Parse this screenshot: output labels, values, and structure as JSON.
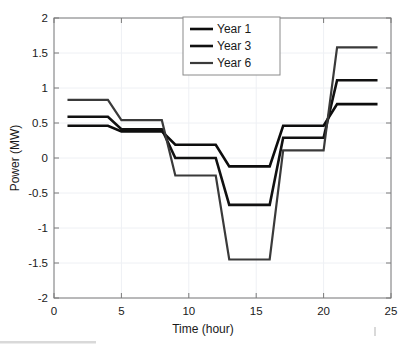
{
  "figure": {
    "background": "#ffffff",
    "plot_area": {
      "left": 54,
      "top": 18,
      "right": 391,
      "bottom": 298
    }
  },
  "chart_data": {
    "type": "line",
    "title": "",
    "xlabel": "Time (hour)",
    "ylabel": "Power (MW)",
    "xlim": [
      0,
      25
    ],
    "ylim": [
      -2,
      2
    ],
    "xticks": [
      0,
      5,
      10,
      15,
      20,
      25
    ],
    "xtick_labels": [
      "0",
      "5",
      "10",
      "15",
      "20",
      "25"
    ],
    "yticks": [
      -2,
      -1.5,
      -1,
      -0.5,
      0,
      0.5,
      1,
      1.5,
      2
    ],
    "ytick_labels": [
      "-2",
      "-1.5",
      "-1",
      "-0.5",
      "0",
      "0.5",
      "1",
      "1.5",
      "2"
    ],
    "grid": true,
    "legend_position": "top-center",
    "legend_entries": [
      "Year 1",
      "Year 3",
      "Year 6"
    ],
    "x": [
      1,
      4,
      5,
      8,
      9,
      12,
      13,
      16,
      17,
      20,
      21,
      24
    ],
    "series": [
      {
        "name": "Year 1",
        "color": "#0d0d0d",
        "width": 2.6,
        "values": [
          0.46,
          0.46,
          0.38,
          0.38,
          0.19,
          0.19,
          -0.12,
          -0.12,
          0.46,
          0.46,
          0.77,
          0.77
        ]
      },
      {
        "name": "Year 3",
        "color": "#111111",
        "width": 2.6,
        "values": [
          0.59,
          0.59,
          0.41,
          0.41,
          0.0,
          0.0,
          -0.67,
          -0.67,
          0.29,
          0.29,
          1.11,
          1.11
        ]
      },
      {
        "name": "Year 6",
        "color": "#3a3a3a",
        "width": 2.2,
        "values": [
          0.83,
          0.83,
          0.54,
          0.54,
          -0.25,
          -0.25,
          -1.45,
          -1.45,
          0.11,
          0.11,
          1.58,
          1.58
        ]
      }
    ]
  },
  "legend": {
    "items": [
      {
        "label": "Year 1"
      },
      {
        "label": "Year 3"
      },
      {
        "label": "Year 6"
      }
    ]
  },
  "axes": {
    "x_title": "Time (hour)",
    "y_title": "Power (MW)"
  }
}
